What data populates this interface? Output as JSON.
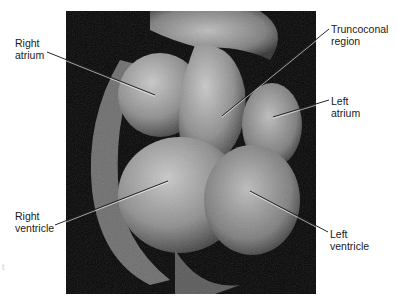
{
  "figure": {
    "labels": [
      {
        "id": "right-atrium",
        "text": "Right\natrium",
        "x": 15,
        "y": 37,
        "point": [
          155,
          95
        ],
        "anchor": [
          47,
          52
        ]
      },
      {
        "id": "truncoconal-region",
        "text": "Truncoconal\nregion",
        "x": 331,
        "y": 23,
        "point": [
          222,
          116
        ],
        "anchor": [
          329,
          29
        ]
      },
      {
        "id": "left-atrium",
        "text": "Left\natrium",
        "x": 331,
        "y": 95,
        "point": [
          273,
          117
        ],
        "anchor": [
          329,
          100
        ]
      },
      {
        "id": "right-ventricle",
        "text": "Right\nventricle",
        "x": 15,
        "y": 210,
        "point": [
          168,
          181
        ],
        "anchor": [
          55,
          225
        ]
      },
      {
        "id": "left-ventricle",
        "text": "Left\nventricle",
        "x": 330,
        "y": 228,
        "point": [
          250,
          191
        ],
        "anchor": [
          328,
          232
        ]
      }
    ],
    "leader_color": "#222222"
  }
}
